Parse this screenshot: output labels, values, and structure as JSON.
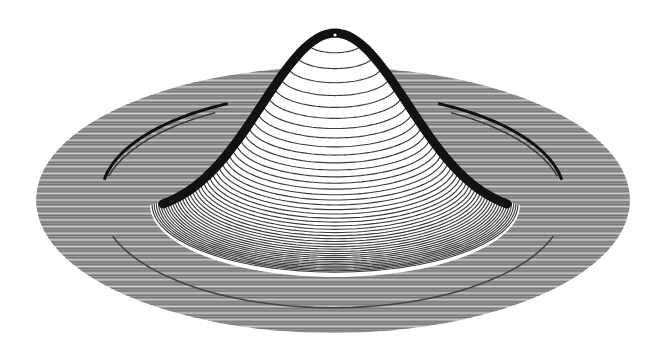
{
  "chart_data": {
    "type": "surface3d",
    "title": "",
    "xlabel": "",
    "ylabel": "",
    "zlabel": "",
    "grid": false,
    "legend": null,
    "surface": {
      "shape": "gaussian_peak_on_disk",
      "peak_height_rel": 1.0,
      "disk_radius_rel": 1.0,
      "peak_base_radius_rel": 0.62,
      "ring_ridge_radius_rel": 0.78
    },
    "projection": {
      "center_px": [
        333,
        200
      ],
      "disk_rx_px": 297,
      "disk_ry_px": 133,
      "peak_apex_px": [
        335,
        30
      ],
      "peak_base_rx_px": 185,
      "peak_base_ry_px": 72,
      "peak_base_center_y_px": 205
    },
    "rendering": {
      "disk_scanlines": 120,
      "dome_contours": 44,
      "line_color": "#3a3a3a",
      "disk_fill": "#9a9a9a",
      "ridge_color": "#111111",
      "background": "#ffffff"
    }
  }
}
